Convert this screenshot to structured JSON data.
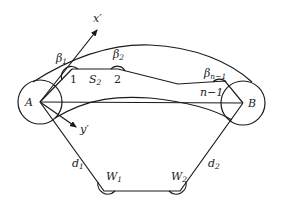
{
  "diagram": {
    "points": {
      "A": "A",
      "B": "B"
    },
    "axes": {
      "x_axis": "x′",
      "y_axis": "y′"
    },
    "nodes": {
      "n1": "1",
      "n2": "2",
      "n_minus_1": "n−1"
    },
    "segment_label": {
      "base": "S",
      "sub": "2"
    },
    "angles": {
      "beta1": {
        "base": "β",
        "sub": "1"
      },
      "beta2": {
        "base": "β",
        "sub": "2"
      },
      "beta_n_minus_1": {
        "base": "β",
        "sub": "n−1"
      },
      "W1": {
        "base": "W",
        "sub": "1"
      },
      "W2": {
        "base": "W",
        "sub": "2"
      }
    },
    "distances": {
      "d1": {
        "base": "d",
        "sub": "1"
      },
      "d2": {
        "base": "d",
        "sub": "2"
      }
    },
    "colors": {
      "stroke": "#1a1a1a",
      "background": "#ffffff"
    }
  }
}
